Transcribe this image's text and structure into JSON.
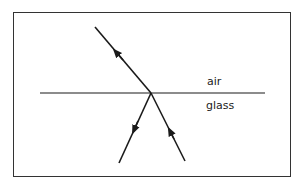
{
  "diagram": {
    "labels": {
      "upper_medium": "air",
      "lower_medium": "glass"
    },
    "rays": [
      {
        "name": "reflected-ray",
        "direction": "up-left, away from interface"
      },
      {
        "name": "refracted-ray",
        "direction": "down-left, away from interface"
      },
      {
        "name": "incident-ray",
        "direction": "up toward interface from glass"
      }
    ],
    "colors": {
      "line": "#1a1a1a",
      "frame": "#333333",
      "background": "#ffffff"
    }
  }
}
